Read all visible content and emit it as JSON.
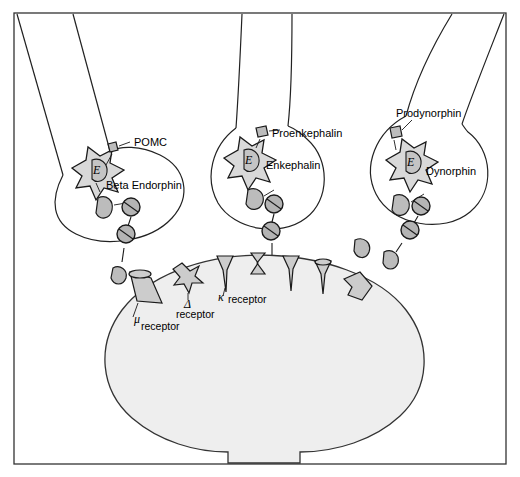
{
  "figure": {
    "frame_color": "#333333",
    "background_color": "#ffffff"
  },
  "terminals": [
    {
      "id": "terminal-left",
      "precursor_label": "POMC",
      "peptide_label": "Beta Endorphin",
      "organelle_label": "E"
    },
    {
      "id": "terminal-middle",
      "precursor_label": "Proenkephalin",
      "peptide_label": "Enkephalin",
      "organelle_label": "E"
    },
    {
      "id": "terminal-right",
      "precursor_label": "Prodynorphin",
      "peptide_label": "Dynorphin",
      "organelle_label": "E"
    }
  ],
  "receptors": [
    {
      "id": "receptor-mu",
      "symbol": "μ",
      "label": "receptor",
      "shape": "trapezoid"
    },
    {
      "id": "receptor-delta",
      "symbol": "Δ",
      "label": "receptor",
      "shape": "star"
    },
    {
      "id": "receptor-kappa",
      "symbol": "κ",
      "label": "receptor",
      "shape": "cone"
    }
  ],
  "postsynaptic_cell": {
    "name": "postsynaptic neuron soma",
    "fill_color": "#eeeeee"
  },
  "palette": {
    "outline": "#222222",
    "golgi_fill": "#d9d9d9",
    "peptide_fill": "#bcbcbc",
    "vesicle_fill": "#b4b4b4",
    "receptor_fill": "#cccccc",
    "soma_fill": "#eeeeee"
  }
}
